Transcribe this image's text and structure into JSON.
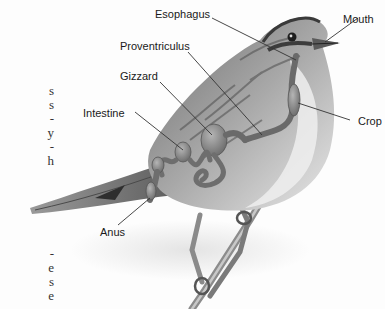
{
  "diagram": {
    "labels": {
      "esophagus": "Esophagus",
      "mouth": "Mouth",
      "proventriculus": "Proventriculus",
      "gizzard": "Gizzard",
      "intestine": "Intestine",
      "crop": "Crop",
      "anus": "Anus"
    },
    "colors": {
      "label_text": "#1a1a1a",
      "leader_line": "#333333",
      "organ_fill": "#8a8a8a",
      "body_light": "#e6e6e6",
      "body_dark": "#5a5a5a"
    }
  },
  "left_text_fragments": {
    "top": [
      "s",
      "s",
      "-",
      "y",
      "-",
      "h"
    ],
    "bottom": [
      "-",
      "e",
      "s",
      "e"
    ]
  }
}
